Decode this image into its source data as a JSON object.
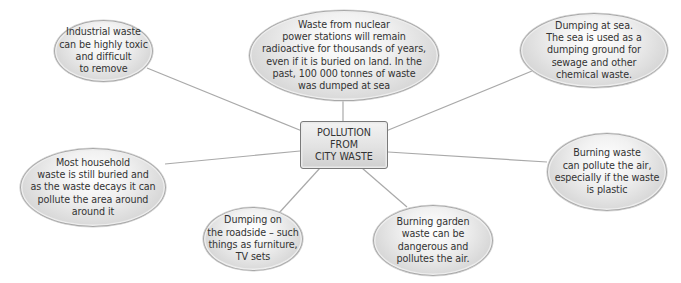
{
  "diagram": {
    "type": "spider-diagram",
    "center": {
      "label": "POLLUTION\nFROM\nCITY WASTE"
    },
    "nodes": [
      {
        "id": "industrial",
        "text": "Industrial waste\ncan be highly toxic\nand difficult\nto remove"
      },
      {
        "id": "nuclear",
        "text": "Waste from nuclear\npower stations will remain\nradioactive for thousands of years,\neven if it is buried on land. In the\npast, 100 000 tonnes of waste\nwas dumped at sea"
      },
      {
        "id": "sea",
        "text": "Dumping at sea.\nThe sea is used as a\ndumping ground for\nsewage and other\nchemical waste."
      },
      {
        "id": "household",
        "text": "Most household\nwaste is still buried and\nas the waste decays it can\npollute the area around\naround it"
      },
      {
        "id": "burning",
        "text": "Burning waste\ncan pollute the air,\nespecially if the waste\nis plastic"
      },
      {
        "id": "roadside",
        "text": "Dumping on\nthe roadside – such\nthings as furniture,\nTV sets"
      },
      {
        "id": "garden",
        "text": "Burning garden\nwaste can be\ndangerous and\npollutes the air."
      }
    ],
    "colors": {
      "line": "#a9a9a9",
      "bubble_border": "#a8a8a8",
      "text": "#333333",
      "box_border": "#7a7a7a"
    }
  }
}
